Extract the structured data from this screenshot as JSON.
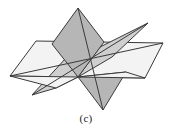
{
  "figure": {
    "caption": "(c)",
    "canvas": {
      "width": 172,
      "height": 135
    },
    "center_point": {
      "x": 78,
      "y": 77
    },
    "colors": {
      "background": "#ffffff",
      "plane_dark_fill": "#b6b6b6",
      "plane_mid_fill": "#cfcfcf",
      "plane_light_fill": "#f3f3f3",
      "plane_lighter_fill": "#e6e6e6",
      "stroke": "#3a3a3a",
      "caption_text": "#1a1a1a"
    },
    "stroke_width": 1,
    "planes": [
      {
        "name": "horizontal-plane",
        "shade": "light",
        "fill": "#f3f3f3",
        "points": "36,41 163,43 145,78 10,76"
      },
      {
        "name": "vertical-plane",
        "shade": "dark",
        "fill": "#b6b6b6",
        "points": "78,8 104,42 103,110 52,44"
      },
      {
        "name": "oblique-plane",
        "shade": "mid",
        "fill": "#cfcfcf",
        "points": "148,23 112,57 32,95 66,58"
      }
    ],
    "segments": [
      {
        "name": "horizontal-plane-left-trace",
        "x1": 10,
        "y1": 76,
        "x2": 163,
        "y2": 43
      },
      {
        "name": "vertical-plane-axis",
        "x1": 78,
        "y1": 8,
        "x2": 103,
        "y2": 110
      },
      {
        "name": "oblique-plane-axis",
        "x1": 148,
        "y1": 23,
        "x2": 32,
        "y2": 95
      }
    ]
  }
}
